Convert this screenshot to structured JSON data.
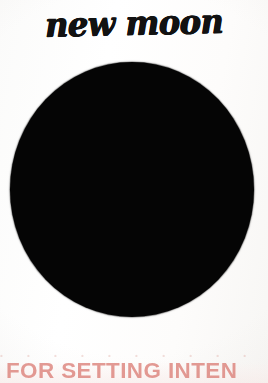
{
  "page": {
    "title": "new moon",
    "background_color": "#fdfdfc"
  },
  "moon": {
    "phase_name": "new moon",
    "symbol_color": "#050505",
    "illumination_percent": 0
  },
  "ghost_row": {
    "text": "• • • • • • • • • • • •",
    "color": "#d6948c"
  },
  "footer": {
    "headline": "FOR SETTING INTEN",
    "headline_full": "FOR SETTING INTENTIONS",
    "color": "#d9756d"
  }
}
